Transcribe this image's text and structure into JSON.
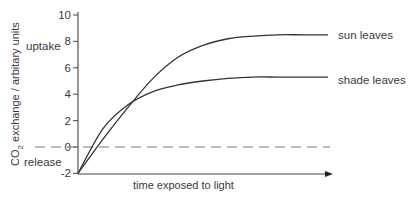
{
  "chart_data": {
    "type": "line",
    "title": "",
    "xlabel": "time exposed to light",
    "ylabel": "CO2 exchange / arbitary units",
    "ylabel_main": "CO",
    "ylabel_sub": "2",
    "ylabel_rest": " exchange / arbitary units",
    "ylim": [
      -2,
      10
    ],
    "yticks": [
      10,
      8,
      6,
      4,
      2,
      0,
      -2
    ],
    "ytick_labels": [
      "10",
      "8",
      "6",
      "4",
      "2",
      "0",
      "-2"
    ],
    "grid": false,
    "reference_line": {
      "y": 0,
      "style": "dashed"
    },
    "annotations": {
      "uptake": "uptake",
      "release": "release"
    },
    "x": [
      0,
      0.1,
      0.2,
      0.3,
      0.4,
      0.5,
      0.6,
      0.7,
      0.8,
      0.9,
      1.0
    ],
    "series": [
      {
        "name": "sun leaves",
        "values": [
          -2,
          0.6,
          3.0,
          5.2,
          6.8,
          7.7,
          8.2,
          8.4,
          8.5,
          8.5,
          8.5
        ]
      },
      {
        "name": "shade leaves",
        "values": [
          -2,
          1.4,
          3.2,
          4.2,
          4.7,
          5.0,
          5.2,
          5.3,
          5.3,
          5.3,
          5.3
        ]
      }
    ]
  }
}
